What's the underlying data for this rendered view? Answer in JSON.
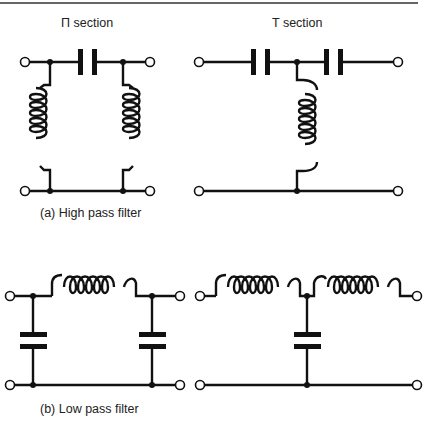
{
  "figure": {
    "high_pass": {
      "caption": "(a) High pass filter",
      "pi_section_label": "Π section",
      "t_section_label": "T section"
    },
    "low_pass": {
      "caption": "(b) Low pass filter"
    }
  },
  "colors": {
    "ink": "#111111",
    "background": "#ffffff"
  }
}
